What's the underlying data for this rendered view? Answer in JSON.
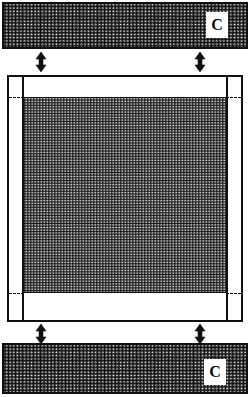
{
  "figure": {
    "kind": "cross-section-diagram",
    "background_color": "#ffffff",
    "line_color": "#101010",
    "hatch_fill": "stipple-gray"
  },
  "top_slab": {
    "name": "upper-hatched-plate",
    "label": "C",
    "fill": "hatched"
  },
  "bottom_slab": {
    "name": "lower-hatched-plate",
    "label": "C",
    "fill": "hatched"
  },
  "center_panel": {
    "name": "central-frame",
    "fill": "white",
    "core_fill": "hatched",
    "has_left_divider": true,
    "has_right_divider": true,
    "dashed_datum_lines": 4
  },
  "arrows": [
    {
      "name": "gap-arrow-top-left",
      "glyph": "↕",
      "direction": "vertical-double"
    },
    {
      "name": "gap-arrow-top-right",
      "glyph": "↕",
      "direction": "vertical-double"
    },
    {
      "name": "gap-arrow-bottom-left",
      "glyph": "↕",
      "direction": "vertical-double"
    },
    {
      "name": "gap-arrow-bottom-right",
      "glyph": "↕",
      "direction": "vertical-double"
    }
  ]
}
